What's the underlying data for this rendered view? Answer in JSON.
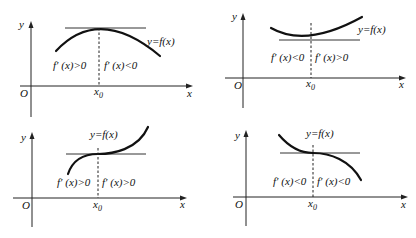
{
  "panels": [
    {
      "id": "local-max",
      "origin_label": "O",
      "x_axis_label": "x",
      "y_axis_label": "y",
      "point_label": "x",
      "point_sub": "0",
      "curve_label": "y=f(x)",
      "left_sign": "f′ (x)>0",
      "right_sign": "f′ (x)<0"
    },
    {
      "id": "local-min",
      "origin_label": "O",
      "x_axis_label": "x",
      "y_axis_label": "y",
      "point_label": "x",
      "point_sub": "0",
      "curve_label": "y=f(x)",
      "left_sign": "f′ (x)<0",
      "right_sign": "f′ (x)>0"
    },
    {
      "id": "increasing-inflection",
      "origin_label": "O",
      "x_axis_label": "x",
      "y_axis_label": "y",
      "point_label": "x",
      "point_sub": "0",
      "curve_label": "y=f(x)",
      "left_sign": "f′ (x)>0",
      "right_sign": "f′ (x)>0"
    },
    {
      "id": "decreasing-inflection",
      "origin_label": "O",
      "x_axis_label": "x",
      "y_axis_label": "y",
      "point_label": "x",
      "point_sub": "0",
      "curve_label": "y=f(x)",
      "left_sign": "f′ (x)<0",
      "right_sign": "f′ (x)<0"
    }
  ]
}
